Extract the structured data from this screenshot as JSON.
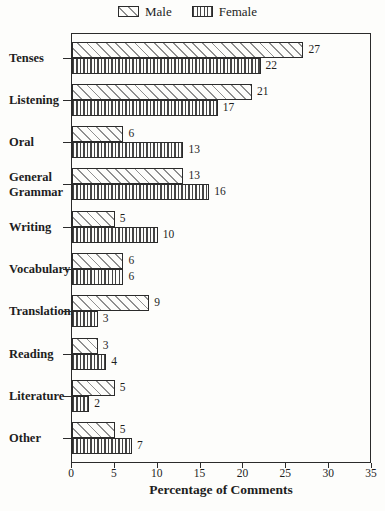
{
  "chart_data": {
    "type": "bar",
    "orientation": "horizontal",
    "title": "",
    "xlabel": "Percentage of Comments",
    "ylabel": "",
    "xlim": [
      0,
      35
    ],
    "x_ticks": [
      0,
      5,
      10,
      15,
      20,
      25,
      30,
      35
    ],
    "grid": false,
    "legend_position": "top-center",
    "value_labels_shown": true,
    "categories": [
      "Tenses",
      "Listening",
      "Oral",
      "General Grammar",
      "Writing",
      "Vocabulary",
      "Translation",
      "Reading",
      "Literature",
      "Other"
    ],
    "series": [
      {
        "name": "Male",
        "pattern": "diagonal-hatch",
        "values": [
          27,
          21,
          6,
          13,
          5,
          6,
          9,
          3,
          5,
          5
        ]
      },
      {
        "name": "Female",
        "pattern": "vertical-hatch",
        "values": [
          22,
          17,
          13,
          16,
          10,
          6,
          3,
          4,
          2,
          7
        ]
      }
    ],
    "colors": {
      "ink": "#2b2b2b",
      "male_hatch": "#8f8f8f",
      "female_hatch": "#454545",
      "background": "#fdfdfb"
    }
  }
}
